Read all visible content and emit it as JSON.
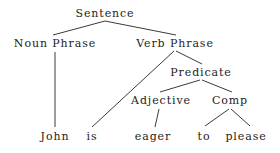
{
  "diagram": {
    "type": "syntax-parse-tree",
    "sentence": "John is eager to please",
    "background_color": "#ffffff",
    "text_color": "#1d1d1d",
    "edge_color": "#3a3a3a",
    "nodes": [
      {
        "id": "sentence",
        "label": "Sentence",
        "x": 105,
        "y": 8,
        "level": 0
      },
      {
        "id": "noun-phrase",
        "label": "Noun Phrase",
        "x": 55,
        "y": 38,
        "level": 1
      },
      {
        "id": "verb-phrase",
        "label": "Verb Phrase",
        "x": 175,
        "y": 38,
        "level": 1
      },
      {
        "id": "predicate",
        "label": "Predicate",
        "x": 201,
        "y": 67,
        "level": 2
      },
      {
        "id": "adjective",
        "label": "Adjective",
        "x": 161,
        "y": 95,
        "level": 3
      },
      {
        "id": "comp",
        "label": "Comp",
        "x": 230,
        "y": 95,
        "level": 3
      },
      {
        "id": "john",
        "label": "John",
        "x": 55,
        "y": 131,
        "level": 4
      },
      {
        "id": "is",
        "label": "is",
        "x": 92,
        "y": 131,
        "level": 4
      },
      {
        "id": "eager",
        "label": "eager",
        "x": 153,
        "y": 131,
        "level": 4
      },
      {
        "id": "to",
        "label": "to",
        "x": 204,
        "y": 131,
        "level": 4
      },
      {
        "id": "please",
        "label": "please",
        "x": 246,
        "y": 131,
        "level": 4
      }
    ],
    "edges": [
      {
        "id": "sentence-noun-phrase",
        "from": "sentence",
        "to": "noun-phrase",
        "x1": 105,
        "y1": 21,
        "x2": 53,
        "y2": 35
      },
      {
        "id": "sentence-verb-phrase",
        "from": "sentence",
        "to": "verb-phrase",
        "x1": 105,
        "y1": 21,
        "x2": 176,
        "y2": 35
      },
      {
        "id": "noun-phrase-john",
        "from": "noun-phrase",
        "to": "john",
        "x1": 55,
        "y1": 52,
        "x2": 55,
        "y2": 127
      },
      {
        "id": "verb-phrase-is",
        "from": "verb-phrase",
        "to": "is",
        "x1": 174,
        "y1": 51,
        "x2": 92,
        "y2": 127
      },
      {
        "id": "verb-phrase-predicate",
        "from": "verb-phrase",
        "to": "predicate",
        "x1": 176,
        "y1": 51,
        "x2": 202,
        "y2": 64
      },
      {
        "id": "predicate-adjective",
        "from": "predicate",
        "to": "adjective",
        "x1": 200,
        "y1": 80,
        "x2": 160,
        "y2": 92
      },
      {
        "id": "predicate-comp",
        "from": "predicate",
        "to": "comp",
        "x1": 202,
        "y1": 80,
        "x2": 232,
        "y2": 92
      },
      {
        "id": "adjective-eager",
        "from": "adjective",
        "to": "eager",
        "x1": 159,
        "y1": 109,
        "x2": 155,
        "y2": 127
      },
      {
        "id": "comp-to",
        "from": "comp",
        "to": "to",
        "x1": 229,
        "y1": 109,
        "x2": 205,
        "y2": 126
      },
      {
        "id": "comp-please",
        "from": "comp",
        "to": "please",
        "x1": 231,
        "y1": 109,
        "x2": 250,
        "y2": 126
      }
    ]
  }
}
